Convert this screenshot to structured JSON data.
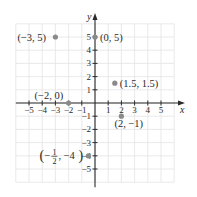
{
  "chart_data": {
    "type": "scatter",
    "title": "",
    "xlabel": "x",
    "ylabel": "y",
    "xlim": [
      -6,
      6
    ],
    "ylim": [
      -6,
      6
    ],
    "grid": true,
    "x_ticks": [
      -5,
      -4,
      -3,
      -2,
      -1,
      1,
      2,
      3,
      4,
      5
    ],
    "y_ticks": [
      5,
      4,
      3,
      2,
      1,
      -1,
      -2,
      -3,
      -4,
      -5
    ],
    "x_tick_labels": [
      "−5",
      "−4",
      "−3",
      "−2",
      "−1",
      "1",
      "2",
      "3",
      "4",
      "5"
    ],
    "y_tick_labels": [
      "5",
      "4",
      "3",
      "2",
      "1",
      "−1",
      "−2",
      "−3",
      "−4",
      "−5"
    ],
    "points": [
      {
        "x": -3,
        "y": 5,
        "label": "(−3, 5)"
      },
      {
        "x": 0,
        "y": 5,
        "label": "(0, 5)"
      },
      {
        "x": 1.5,
        "y": 1.5,
        "label": "(1.5, 1.5)"
      },
      {
        "x": -2,
        "y": 0,
        "label": "(−2, 0)"
      },
      {
        "x": 2,
        "y": -1,
        "label": "(2, −1)"
      },
      {
        "x": -0.5,
        "y": -4,
        "label": "(−1/2, −4)"
      }
    ]
  },
  "colors": {
    "point": "#8a8a8a",
    "axis": "#2a2a2a",
    "grid": "#e3e3e3"
  }
}
